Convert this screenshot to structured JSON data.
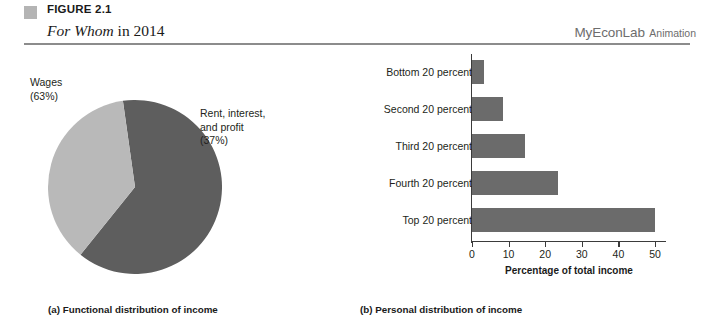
{
  "header": {
    "figure_number": "FIGURE 2.1",
    "title_italic": "For Whom",
    "title_rest": " in 2014",
    "brand": "MyEconLab",
    "brand_suffix": "Animation",
    "marker_color": "#b4b4b4",
    "rule_color": "#8c8c8c"
  },
  "panel_a": {
    "caption": "(a) Functional distribution of income",
    "label_wages": "Wages\n(63%)",
    "label_wages_line1": "Wages",
    "label_wages_line2": "(63%)",
    "label_rent_line1": "Rent, interest,",
    "label_rent_line2": "and profit",
    "label_rent_line3": "(37%)"
  },
  "panel_b": {
    "caption": "(b) Personal distribution of income",
    "axis_title": "Percentage of total income"
  },
  "chart_data": [
    {
      "type": "pie",
      "title": "Functional distribution of income",
      "slices": [
        {
          "label": "Wages",
          "value": 63,
          "display": "Wages (63%)",
          "color": "#5e5e5e"
        },
        {
          "label": "Rent, interest, and profit",
          "value": 37,
          "display": "Rent, interest, and profit (37%)",
          "color": "#b9b9b9"
        }
      ],
      "units": "percent",
      "legend": "labels placed outside slices",
      "start_angle_deg": 0
    },
    {
      "type": "bar",
      "orientation": "horizontal",
      "title": "Personal distribution of income",
      "categories": [
        "Bottom 20 percent",
        "Second 20 percent",
        "Third 20 percent",
        "Fourth 20 percent",
        "Top 20 percent"
      ],
      "values": [
        3.4,
        8.5,
        14.6,
        23.4,
        50.1
      ],
      "xlabel": "Percentage of total income",
      "ylabel": "",
      "xlim": [
        0,
        53
      ],
      "xticks": [
        0,
        10,
        20,
        30,
        40,
        50
      ],
      "xtick_labels": [
        "0",
        "10",
        "20",
        "30",
        "40",
        "50"
      ],
      "grid": false,
      "bar_color": "#6b6b6b"
    }
  ]
}
